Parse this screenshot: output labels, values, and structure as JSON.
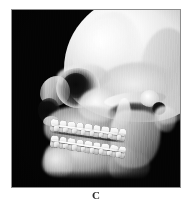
{
  "figure": {
    "panel_label": "C",
    "caption_label": "C",
    "modality_icon": "skull-3d-reconstruction-icon",
    "background_color": "#040404",
    "border_color": "#8d8d8d",
    "bone_highlight_color": "#ffffff",
    "bone_midtone_color": "#c8c8c8",
    "cavity_shadow_color": "#0a0a0a",
    "caption_color": "#2b2b2b"
  },
  "render": {
    "view_name": "lateral-oblique-right",
    "subject": "skull-with-orthodontic-appliance",
    "structures": [
      {
        "name": "cranial-vault",
        "label": "Cranial vault"
      },
      {
        "name": "frontal-bone",
        "label": "Frontal bone"
      },
      {
        "name": "occipital-region",
        "label": "Occipital region"
      },
      {
        "name": "temporal-squama",
        "label": "Temporal squama"
      },
      {
        "name": "supraorbital-ridge",
        "label": "Supraorbital ridge"
      },
      {
        "name": "orbital-rim",
        "label": "Orbital rim"
      },
      {
        "name": "orbital-cavity",
        "label": "Orbital cavity"
      },
      {
        "name": "nasal-bridge",
        "label": "Nasal bridge"
      },
      {
        "name": "piriform-aperture",
        "label": "Piriform aperture"
      },
      {
        "name": "anterior-nasal-spine",
        "label": "Anterior nasal spine"
      },
      {
        "name": "maxilla",
        "label": "Maxilla"
      },
      {
        "name": "zygomatic-bone",
        "label": "Zygomatic bone"
      },
      {
        "name": "zygomatic-arch",
        "label": "Zygomatic arch"
      },
      {
        "name": "infratemporal-fossa",
        "label": "Infratemporal fossa"
      },
      {
        "name": "coronoid-process",
        "label": "Coronoid process"
      },
      {
        "name": "mandibular-condyle",
        "label": "Mandibular condyle"
      },
      {
        "name": "external-auditory-meatus",
        "label": "External auditory meatus"
      },
      {
        "name": "mastoid-process",
        "label": "Mastoid process"
      },
      {
        "name": "mandibular-ramus",
        "label": "Mandibular ramus"
      },
      {
        "name": "mandibular-body",
        "label": "Mandibular body"
      },
      {
        "name": "mental-protuberance",
        "label": "Mental protuberance"
      },
      {
        "name": "gonial-angle",
        "label": "Gonial angle"
      }
    ],
    "dentition": {
      "upper_arch_teeth": 9,
      "lower_arch_teeth": 9,
      "upper_brackets": 8,
      "lower_brackets": 8,
      "archwire_upper": true,
      "archwire_lower": true
    }
  }
}
